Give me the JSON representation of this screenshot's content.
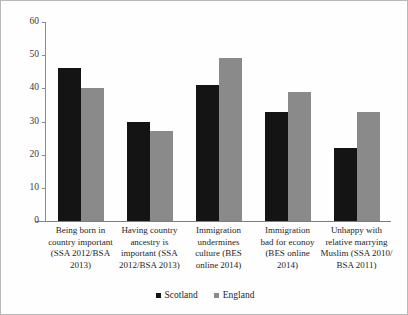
{
  "chart_data": {
    "type": "bar",
    "title": "",
    "xlabel": "",
    "ylabel": "",
    "ylim": [
      0,
      60
    ],
    "yticks": [
      0,
      10,
      20,
      30,
      40,
      50,
      60
    ],
    "grid": false,
    "legend_position": "bottom-center",
    "categories": [
      "Being born in country important (SSA 2012/BSA 2013)",
      "Having country ancestry is important (SSA 2012/BSA 2013)",
      "Immigration undermines culture (BES online 2014)",
      "Immigration bad for econoy (BES online 2014)",
      "Unhappy with relative marrying Muslim (SSA 2010/BSA 2011)"
    ],
    "series": [
      {
        "name": "Scotland",
        "color": "#141414",
        "values": [
          46,
          30,
          41,
          33,
          22
        ]
      },
      {
        "name": "England",
        "color": "#8a8a8a",
        "values": [
          40,
          27,
          49,
          39,
          33
        ]
      }
    ]
  },
  "axis": {
    "tick_labels": [
      "60",
      "50",
      "40",
      "30",
      "20",
      "10",
      "0"
    ]
  },
  "legend": {
    "items": [
      {
        "label": "Scotland"
      },
      {
        "label": "England"
      }
    ]
  },
  "category_lines": [
    [
      "Being born in",
      "country important",
      "(SSA 2012/BSA",
      "2013)"
    ],
    [
      "Having country",
      "ancestry is",
      "important (SSA",
      "2012/BSA 2013)"
    ],
    [
      "Immigration",
      "undermines",
      "culture (BES",
      "online 2014)"
    ],
    [
      "Immigration",
      "bad for econoy",
      "(BES online",
      "2014)"
    ],
    [
      "Unhappy with",
      "relative marrying",
      "Muslim (SSA 2010/",
      "BSA 2011)"
    ]
  ]
}
